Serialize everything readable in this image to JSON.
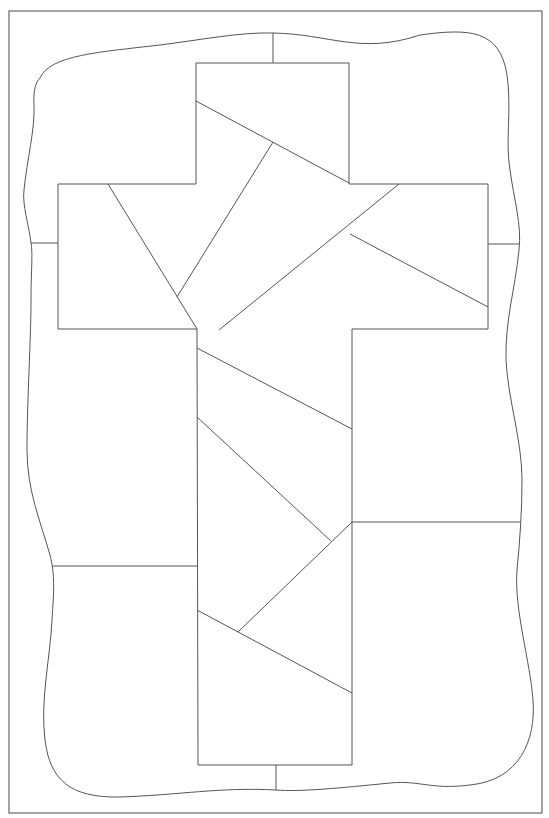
{
  "page": {
    "header_text": "",
    "type": "coloring page / quilt pattern",
    "stroke_color": "#555555",
    "background_color": "#ffffff"
  },
  "diagram": {
    "title": "",
    "frame": {
      "x": 9,
      "y": 11,
      "width": 533,
      "height": 802
    },
    "wavy_border": {
      "path": "M 40 78 C 50 55, 100 52, 160 45 C 200 40, 240 32, 273 33 C 330 34, 360 55, 420 35 C 470 28, 500 30, 507 75 C 512 110, 505 140, 510 170 C 514 200, 522 225, 519 250 C 515 290, 505 320, 506 360 C 508 400, 522 440, 522 480 C 522 510, 520 540, 517 570 C 514 610, 530 660, 533 700 C 536 740, 520 780, 470 785 C 430 790, 420 780, 390 783 C 340 788, 300 792, 276 790 C 220 787, 180 795, 120 797 C 70 798, 50 780, 45 740 C 40 700, 50 660, 52 620 C 54 590, 55 575, 50 555 C 40 520, 27 490, 27 450 C 27 400, 31 340, 31 300 C 31 270, 33 255, 31 243 C 29 225, 22 205, 24 190 C 27 160, 35 130, 34 105 C 33 90, 36 82, 40 78 Z"
    },
    "cross": {
      "points": [
        [
          196,
          63
        ],
        [
          349,
          63
        ],
        [
          349,
          184
        ],
        [
          488,
          184
        ],
        [
          488,
          329
        ],
        [
          352,
          329
        ],
        [
          352,
          765
        ],
        [
          198,
          765
        ],
        [
          197,
          329
        ],
        [
          58,
          329
        ],
        [
          58,
          184
        ],
        [
          196,
          184
        ]
      ]
    },
    "segments": [
      {
        "name": "top-center-tick",
        "x1": 273,
        "y1": 33,
        "x2": 273,
        "y2": 63
      },
      {
        "name": "bottom-center-tick",
        "x1": 276,
        "y1": 765,
        "x2": 276,
        "y2": 790
      },
      {
        "name": "left-tick",
        "x1": 31,
        "y1": 243,
        "x2": 58,
        "y2": 243
      },
      {
        "name": "right-tick",
        "x1": 488,
        "y1": 244,
        "x2": 519,
        "y2": 244
      },
      {
        "name": "left-lower-divider",
        "x1": 52,
        "y1": 566,
        "x2": 197,
        "y2": 566
      },
      {
        "name": "right-lower-divider",
        "x1": 352,
        "y1": 522,
        "x2": 521,
        "y2": 522
      },
      {
        "name": "top-slant",
        "x1": 196,
        "y1": 101,
        "x2": 349,
        "y2": 183
      },
      {
        "name": "top-inner-slant",
        "x1": 273,
        "y1": 142,
        "x2": 177,
        "y2": 297
      },
      {
        "name": "left-arm-slant",
        "x1": 108,
        "y1": 184,
        "x2": 197,
        "y2": 329
      },
      {
        "name": "right-arm-long-slant",
        "x1": 399,
        "y1": 184,
        "x2": 219,
        "y2": 330
      },
      {
        "name": "right-arm-slant",
        "x1": 350,
        "y1": 234,
        "x2": 488,
        "y2": 307
      },
      {
        "name": "stem-slant-1",
        "x1": 197,
        "y1": 348,
        "x2": 352,
        "y2": 429
      },
      {
        "name": "stem-slant-2",
        "x1": 197,
        "y1": 417,
        "x2": 331,
        "y2": 541
      },
      {
        "name": "stem-slant-3",
        "x1": 352,
        "y1": 522,
        "x2": 238,
        "y2": 632
      },
      {
        "name": "stem-slant-4",
        "x1": 197,
        "y1": 610,
        "x2": 352,
        "y2": 693
      }
    ]
  }
}
